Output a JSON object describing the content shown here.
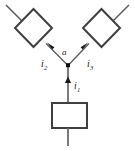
{
  "figure": {
    "type": "circuit-diagram",
    "background_color": "#ffffff",
    "line_color": "#4a4a4a",
    "element_stroke_color": "#3a3a3a",
    "node_color": "#1a1a1a",
    "label_color": "#1a1a1a"
  },
  "labels": {
    "node_a": "a",
    "current_1_symbol": "i",
    "current_1_subscript": "1",
    "current_2_symbol": "i",
    "current_2_subscript": "2",
    "current_3_symbol": "i",
    "current_3_subscript": "3"
  },
  "elements": {
    "left_element": {
      "name": "diamond-element-left",
      "shape": "diamond"
    },
    "right_element": {
      "name": "diamond-element-right",
      "shape": "diamond"
    },
    "bottom_element": {
      "name": "square-element-bottom",
      "shape": "square"
    },
    "junction": {
      "name": "junction-node-a",
      "shape": "filled-square-dot"
    }
  },
  "caption": {
    "text": ""
  }
}
